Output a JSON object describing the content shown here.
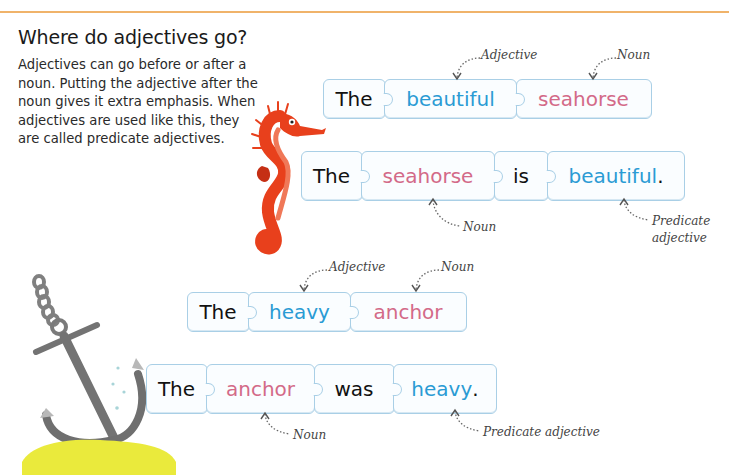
{
  "heading": "Where do adjectives go?",
  "intro": "Adjectives can go before or after a noun. Putting the adjective after the noun gives it extra emphasis. When adjectives are used like this, they are called predicate adjectives.",
  "colors": {
    "adjective": "#2a9bd4",
    "noun": "#d36a88",
    "text": "#111111",
    "piece_border": "#a9cfe6",
    "header_rule": "#f0b36a"
  },
  "examples": {
    "seahorse_attributive": {
      "words": [
        {
          "text": "The",
          "role": "article"
        },
        {
          "text": "beautiful",
          "role": "adjective"
        },
        {
          "text": "seahorse",
          "role": "noun"
        }
      ],
      "labels": {
        "adjective": "Adjective",
        "noun": "Noun"
      }
    },
    "seahorse_predicate": {
      "words": [
        {
          "text": "The",
          "role": "article"
        },
        {
          "text": "seahorse",
          "role": "noun"
        },
        {
          "text": "is",
          "role": "verb"
        },
        {
          "text": "beautiful",
          "role": "adjective"
        },
        {
          "text": ".",
          "role": "punctuation"
        }
      ],
      "labels": {
        "noun": "Noun",
        "predicate_line1": "Predicate",
        "predicate_line2": "adjective"
      }
    },
    "anchor_attributive": {
      "words": [
        {
          "text": "The",
          "role": "article"
        },
        {
          "text": "heavy",
          "role": "adjective"
        },
        {
          "text": "anchor",
          "role": "noun"
        }
      ],
      "labels": {
        "adjective": "Adjective",
        "noun": "Noun"
      }
    },
    "anchor_predicate": {
      "words": [
        {
          "text": "The",
          "role": "article"
        },
        {
          "text": "anchor",
          "role": "noun"
        },
        {
          "text": "was",
          "role": "verb"
        },
        {
          "text": "heavy",
          "role": "adjective"
        },
        {
          "text": ".",
          "role": "punctuation"
        }
      ],
      "labels": {
        "noun": "Noun",
        "predicate": "Predicate adjective"
      }
    }
  },
  "illustrations": {
    "seahorse": "seahorse-illustration",
    "anchor": "anchor-illustration"
  }
}
